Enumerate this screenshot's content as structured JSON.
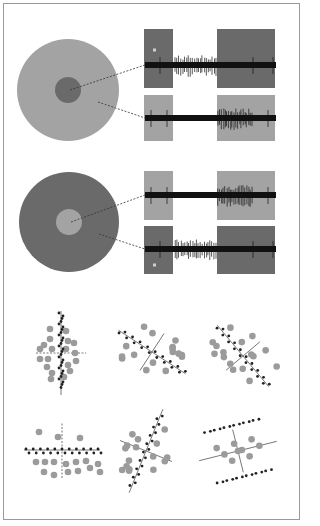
{
  "figure": {
    "title": "",
    "colors": {
      "background": "#ffffff",
      "frame_border": "#9a9a9a",
      "light_gray": "#a3a3a3",
      "dark_gray": "#6a6a6a",
      "trace": "#111111",
      "dashed_line": "#333333",
      "large_dot": "#9b9b9b",
      "small_dot": "#222222",
      "axis": "#555555"
    }
  },
  "receptive_fields": [
    {
      "name": "on-center",
      "surround_color": "#a3a3a3",
      "center_color": "#6a6a6a",
      "cx": 68,
      "cy": 90,
      "r_outer": 51,
      "r_inner": 13,
      "traces": [
        {
          "source": "center",
          "box_color": "#6a6a6a",
          "y_top": 29,
          "y_bottom": 88,
          "baseline_y": 65,
          "burst_region": "gap",
          "marker_dot": true
        },
        {
          "source": "surround",
          "box_color": "#a3a3a3",
          "y_top": 95,
          "y_bottom": 141,
          "baseline_y": 118,
          "burst_region": "right",
          "marker_dot": false
        }
      ]
    },
    {
      "name": "off-center",
      "surround_color": "#6a6a6a",
      "center_color": "#a3a3a3",
      "cx": 69,
      "cy": 222,
      "r_outer": 50,
      "r_inner": 13,
      "traces": [
        {
          "source": "center",
          "box_color": "#a3a3a3",
          "y_top": 171,
          "y_bottom": 220,
          "baseline_y": 195,
          "burst_region": "right",
          "marker_dot": false
        },
        {
          "source": "surround",
          "box_color": "#6a6a6a",
          "y_top": 226,
          "y_bottom": 274,
          "baseline_y": 249,
          "burst_region": "gap",
          "marker_dot": true
        }
      ]
    }
  ],
  "trace_layout": {
    "left_box_x1": 144,
    "left_box_x2": 173,
    "right_box_x1": 217,
    "right_box_x2": 275,
    "trace_x1": 145,
    "trace_x2": 276
  },
  "scatter_panels": [
    {
      "id": 1,
      "cx": 61,
      "cy": 353,
      "axis1_angle": 90,
      "axis2_angle": 0,
      "dashed_axis": 2,
      "layout": "vertical"
    },
    {
      "id": 2,
      "cx": 152,
      "cy": 352,
      "axis1_angle": -33,
      "axis2_angle": 57,
      "dashed_axis": 0,
      "layout": "diag"
    },
    {
      "id": 3,
      "cx": 243,
      "cy": 356,
      "axis1_angle": -50,
      "axis2_angle": 40,
      "dashed_axis": 0,
      "layout": "diag-steep"
    },
    {
      "id": 4,
      "cx": 62,
      "cy": 450,
      "axis1_angle": 0,
      "axis2_angle": 90,
      "dashed_axis": 2,
      "layout": "horizontal"
    },
    {
      "id": 5,
      "cx": 146,
      "cy": 451,
      "axis1_angle": 68,
      "axis2_angle": -22,
      "dashed_axis": 0,
      "layout": "tilted"
    },
    {
      "id": 6,
      "cx": 238,
      "cy": 451,
      "axis1_angle": 14,
      "axis2_angle": -76,
      "dashed_axis": 0,
      "layout": "two-bands"
    }
  ]
}
